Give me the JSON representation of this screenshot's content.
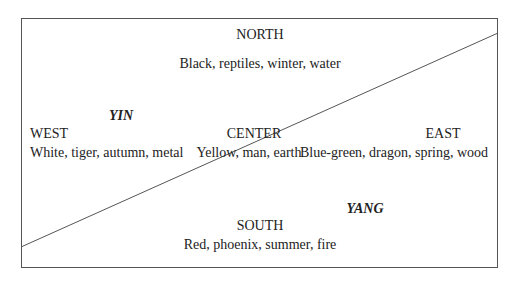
{
  "diagram": {
    "north": {
      "title": "NORTH",
      "attributes": "Black, reptiles, winter, water"
    },
    "west": {
      "title": "WEST",
      "attributes": "White, tiger, autumn, metal"
    },
    "center": {
      "title": "CENTER",
      "attributes": "Yellow, man, earth"
    },
    "east": {
      "title": "EAST",
      "attributes": "Blue-green, dragon, spring, wood"
    },
    "south": {
      "title": "SOUTH",
      "attributes": "Red, phoenix, summer, fire"
    },
    "yin_label": "YIN",
    "yang_label": "YANG",
    "colors": {
      "line": "#555555",
      "text": "#222222",
      "background": "#ffffff"
    }
  }
}
